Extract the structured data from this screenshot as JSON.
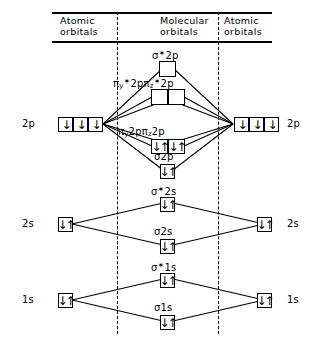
{
  "header": {
    "left": "Atomic\norbitals",
    "middle": "Molecular\norbitals",
    "right": "Atomic\norbitals"
  },
  "atomic_levels": {
    "left": [
      {
        "label": "2p",
        "electrons": [
          "↓",
          "↓",
          "↓"
        ]
      },
      {
        "label": "2s",
        "electrons": [
          "↓↑"
        ]
      },
      {
        "label": "1s",
        "electrons": [
          "↓↑"
        ]
      }
    ],
    "right": [
      {
        "label": "2p",
        "electrons": [
          "↓",
          "↓",
          "↓"
        ]
      },
      {
        "label": "2s",
        "electrons": [
          "↓↑"
        ]
      },
      {
        "label": "1s",
        "electrons": [
          "↓↑"
        ]
      }
    ]
  },
  "molecular_orbitals": [
    {
      "name": "sigma-star-2p",
      "label_html": "σ<span class=\"star\">✶</span>2p",
      "boxes": [
        ""
      ]
    },
    {
      "name": "pi-star-2p",
      "label_html": "π<sub>y</sub><span class=\"star\">✶</span>2pπ<sub>z</sub><span class=\"star\">✶</span>2p",
      "boxes": [
        "",
        ""
      ]
    },
    {
      "name": "pi-2p",
      "label_html": "π<sub>y</sub>2pπ<sub>z</sub>2p",
      "boxes": [
        "↓↑",
        "↓↑"
      ]
    },
    {
      "name": "sigma-2p",
      "label_html": "σ2p",
      "boxes": [
        "↓↑"
      ]
    },
    {
      "name": "sigma-star-2s",
      "label_html": "σ<span class=\"star\">✶</span>2s",
      "boxes": [
        "↓↑"
      ]
    },
    {
      "name": "sigma-2s",
      "label_html": "σ2s",
      "boxes": [
        "↓↑"
      ]
    },
    {
      "name": "sigma-star-1s",
      "label_html": "σ<span class=\"star\">✶</span>1s",
      "boxes": [
        "↓↑"
      ]
    },
    {
      "name": "sigma-1s",
      "label_html": "σ1s",
      "boxes": [
        "↓↑"
      ]
    }
  ],
  "colors": {
    "line": "#000000",
    "background": "#ffffff"
  }
}
